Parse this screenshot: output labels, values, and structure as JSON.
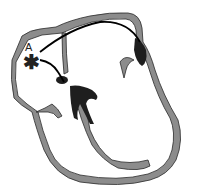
{
  "diagram": {
    "labels": {
      "a": "A",
      "star": "✱"
    },
    "colors": {
      "wall": "#8c8c8c",
      "outline": "#2a2a2a",
      "dark": "#1e1e1e",
      "background": "#ffffff"
    }
  }
}
